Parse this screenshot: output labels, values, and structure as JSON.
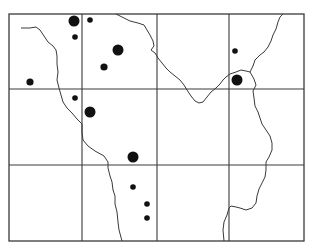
{
  "map": {
    "frame": {
      "x1": 9,
      "y1": 14,
      "x2": 304,
      "y2": 241,
      "stroke": "#3a3a3a"
    },
    "grid": {
      "verticals": [
        82,
        157,
        229
      ],
      "horizontals": [
        89,
        165
      ],
      "stroke": "#3a3a3a"
    },
    "boundaries": [
      {
        "name": "western-boundary",
        "points": "21,28 30,28 36,27 40,30 44,36 48,42 53,46 56,50 57,56 57,64 58,72 57,80 59,88 61,95 63,102 67,108 72,113 77,119 82,124 82,132 83,140 88,146 95,151 104,156 108,162 108,168 110,176 112,182 113,190 115,196 115,204 117,212 118,222 119,230 122,241"
      },
      {
        "name": "northern-river",
        "points": "116,14 122,17 130,21 138,23 144,25 147,30 150,35 153,41 154,46 151,50 155,53 158,58 162,63 166,68 170,72 175,76 180,80 184,85 187,90 191,96 195,101 199,103 203,102 207,97 211,92 216,88 220,84 223,80 226,77 230,74 236,72 241,70 246,71 250,72"
      },
      {
        "name": "north-east-branch",
        "points": "250,72 253,66 255,60 260,55 264,52 268,47 271,41 273,35 276,29 278,22 280,17 283,14"
      },
      {
        "name": "southern-river",
        "points": "250,72 254,79 256,85 253,91 254,98 255,106 258,112 260,118 262,124 266,130 270,136 272,143 272,150 269,157 266,162 266,170 265,177 262,183 259,189 257,196 256,203 252,208 246,210 240,208 236,207 231,206 229,208 227,215 224,222 223,230 224,241"
      }
    ],
    "sites": [
      {
        "name": "site-large",
        "cx": 74,
        "cy": 21,
        "r": 5.5
      },
      {
        "name": "site-small",
        "cx": 90,
        "cy": 20,
        "r": 2.8
      },
      {
        "name": "site-small",
        "cx": 75,
        "cy": 37,
        "r": 2.8
      },
      {
        "name": "site-large",
        "cx": 118,
        "cy": 50,
        "r": 5.5
      },
      {
        "name": "site-medium",
        "cx": 104,
        "cy": 67,
        "r": 3.6
      },
      {
        "name": "site-medium",
        "cx": 30,
        "cy": 82,
        "r": 3.6
      },
      {
        "name": "site-small",
        "cx": 75,
        "cy": 98,
        "r": 2.8
      },
      {
        "name": "site-large",
        "cx": 90,
        "cy": 112,
        "r": 5.5
      },
      {
        "name": "site-large",
        "cx": 133,
        "cy": 157,
        "r": 5.5
      },
      {
        "name": "site-small",
        "cx": 133,
        "cy": 187,
        "r": 2.8
      },
      {
        "name": "site-small",
        "cx": 147,
        "cy": 204,
        "r": 2.8
      },
      {
        "name": "site-small",
        "cx": 147,
        "cy": 218,
        "r": 2.8
      },
      {
        "name": "site-small",
        "cx": 235,
        "cy": 51,
        "r": 2.8
      },
      {
        "name": "site-large",
        "cx": 237,
        "cy": 80,
        "r": 5.5
      }
    ],
    "colors": {
      "ink": "#111111",
      "line": "#3a3a3a",
      "background": "#ffffff"
    }
  }
}
